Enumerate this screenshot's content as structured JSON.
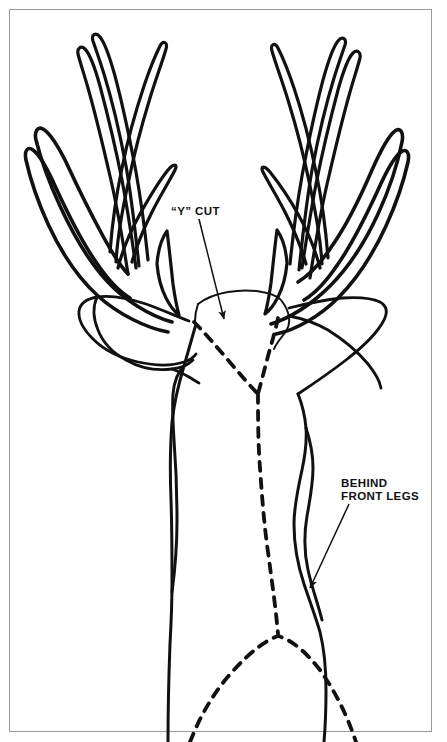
{
  "document": {
    "kind": "line-art-diagram",
    "subject": "deer head and cape with taxidermy cut lines",
    "background_color": "#ffffff",
    "ink_color": "#111111",
    "frame_color": "#9a9a9a"
  },
  "annotations": {
    "y_cut": {
      "label": "“Y” CUT",
      "leader": {
        "from_x": 199,
        "from_y": 219,
        "to_x": 224,
        "to_y": 319
      }
    },
    "behind_front_legs": {
      "label": "BEHIND\nFRONT LEGS",
      "leader": {
        "from_x": 349,
        "from_y": 504,
        "to_x": 310,
        "to_y": 588
      }
    }
  },
  "chart_data": {
    "type": "line",
    "title": "",
    "xlabel": "",
    "ylabel": "",
    "grid": false,
    "legend": "none",
    "xlim": [
      0,
      447
    ],
    "ylim": [
      0,
      742
    ],
    "series": [
      {
        "name": "left-antler-outer-beam",
        "style": "solid",
        "path": "M 172 322 C 150 316 124 300 106 280 C 86 258 72 232 60 206 C 48 180 40 156 36 140 C 34 131 38 126 43 129 C 50 133 58 146 66 162 C 78 188 92 216 104 238 C 114 256 122 268 128 274"
      },
      {
        "name": "left-antler-inner-beam",
        "style": "solid",
        "path": "M 168 332 C 146 328 118 314 98 296 C 76 276 60 250 48 224 C 38 202 30 178 26 160 C 24 150 28 146 33 150 C 40 155 48 170 56 188 C 68 214 82 242 96 262 C 108 280 120 292 130 298"
      },
      {
        "name": "left-antler-tine-1",
        "style": "solid",
        "path": "M 128 274 C 124 248 118 210 110 176 C 104 150 96 116 88 88 C 84 74 80 62 78 54 C 77 48 81 45 85 49 C 90 54 95 68 100 86 C 108 116 116 150 122 180 C 128 212 133 246 136 268"
      },
      {
        "name": "left-antler-tine-2",
        "style": "solid",
        "path": "M 139 266 C 136 238 132 200 126 166 C 120 134 112 100 104 74 C 99 58 95 47 93 41 C 91 34 96 32 100 37 C 105 43 110 58 115 76 C 123 106 130 140 136 172 C 142 206 146 240 148 260"
      },
      {
        "name": "left-antler-tine-3-upper",
        "style": "solid",
        "path": "M 110 252 C 112 226 116 196 122 168 C 128 138 136 110 144 86 C 150 68 156 54 160 46 C 163 40 168 42 166 49 C 163 60 156 78 150 98 C 142 124 134 154 128 184 C 121 216 117 244 116 262"
      },
      {
        "name": "left-antler-mid-fork",
        "style": "solid",
        "path": "M 118 268 C 122 252 130 232 140 214 C 150 196 160 180 168 170 C 174 163 178 164 175 170 C 170 180 160 196 152 212 C 143 230 136 248 132 262"
      },
      {
        "name": "left-brow-tine",
        "style": "solid",
        "path": "M 167 231 C 169 246 171 266 173 284 C 175 298 177 308 179 315 C 175 312 170 306 166 298 C 161 288 158 276 157 264 C 158 250 162 238 167 231"
      },
      {
        "name": "left-ear",
        "style": "solid",
        "path": "M 189 321 C 176 316 160 309 146 304 C 128 298 110 295 97 297 C 86 299 80 304 79 311 C 78 320 84 330 93 339 C 104 350 120 358 138 362 C 156 366 172 366 184 362 C 190 360 194 357 196 354"
      },
      {
        "name": "left-ear-lower-edge",
        "style": "solid",
        "path": "M 97 297 C 93 306 93 318 98 330 C 103 343 113 353 126 360 C 140 368 157 371 172 369 C 182 368 189 364 193 360"
      },
      {
        "name": "left-ear-tip-to-neck",
        "style": "solid",
        "path": "M 172 369 C 178 371 184 374 189 377 C 194 380 197 382 199 383"
      },
      {
        "name": "right-antler-outer-beam",
        "style": "solid",
        "path": "M 271 324 C 290 318 312 304 330 286 C 350 266 366 240 378 214 C 390 188 398 162 402 142 C 404 132 400 127 395 131 C 388 136 380 152 372 170 C 360 198 346 226 332 246 C 320 264 308 276 298 282"
      },
      {
        "name": "right-antler-inner-beam",
        "style": "solid",
        "path": "M 276 334 C 296 330 320 316 338 298 C 358 278 374 252 386 226 C 396 204 404 180 408 162 C 410 152 406 148 401 152 C 394 157 386 172 378 190 C 366 216 352 244 338 264 C 326 282 314 294 304 300"
      },
      {
        "name": "right-antler-tine-1",
        "style": "solid",
        "path": "M 310 278 C 314 252 320 214 328 180 C 334 154 342 120 350 92 C 354 78 358 66 360 58 C 361 52 357 49 353 53 C 348 58 343 72 338 90 C 330 120 322 154 316 184 C 310 216 305 248 302 268"
      },
      {
        "name": "right-antler-tine-2",
        "style": "solid",
        "path": "M 299 270 C 302 242 306 204 312 170 C 318 138 326 104 334 78 C 339 62 343 51 345 45 C 347 38 342 36 338 41 C 333 47 328 62 323 80 C 315 110 308 144 302 176 C 296 210 292 244 290 264"
      },
      {
        "name": "right-antler-tine-3-upper",
        "style": "solid",
        "path": "M 328 258 C 326 232 322 200 316 172 C 310 142 302 112 294 88 C 288 70 282 56 278 48 C 275 42 270 44 272 51 C 275 62 282 80 288 100 C 296 126 304 156 310 186 C 317 218 321 246 322 264"
      },
      {
        "name": "right-antler-mid-fork",
        "style": "solid",
        "path": "M 320 268 C 316 252 308 232 298 214 C 288 196 278 182 270 172 C 264 165 260 166 263 172 C 268 182 278 198 286 214 C 295 232 302 250 306 264"
      },
      {
        "name": "right-brow-tine",
        "style": "solid",
        "path": "M 277 230 C 275 245 273 265 271 283 C 269 297 267 307 265 314 C 269 311 274 305 278 297 C 283 287 286 275 287 263 C 286 249 282 237 277 230"
      },
      {
        "name": "right-ear",
        "style": "solid",
        "path": "M 289 308 C 305 304 324 300 342 298 C 358 297 372 298 380 302 C 387 306 388 312 384 320 C 378 332 364 346 346 360 C 328 374 310 386 298 394"
      },
      {
        "name": "right-ear-lower-edge",
        "style": "solid",
        "path": "M 289 316 C 300 318 314 322 328 330 C 344 340 358 352 368 364 C 376 374 380 382 381 388"
      },
      {
        "name": "skull-plate-top",
        "style": "solid",
        "path": "M 198 304 C 206 298 216 294 228 292 C 240 290 252 290 262 292 C 270 293 276 296 280 299"
      },
      {
        "name": "skull-plate-left-edge",
        "style": "solid",
        "path": "M 198 304 C 196 310 195 316 195 321"
      },
      {
        "name": "skull-right-notch",
        "style": "solid",
        "path": "M 281 300 C 285 305 288 311 289 317 C 290 323 288 329 284 334 C 280 339 276 344 274 349"
      },
      {
        "name": "neck-left-outline",
        "style": "solid",
        "path": "M 196 324 C 192 338 188 352 184 366 C 178 386 174 404 172 422 C 170 448 170 474 171 500 C 172 528 172 556 172 582 C 172 606 171 626 170 644 C 169 670 168 700 168 742"
      },
      {
        "name": "neck-left-outline-waver",
        "style": "solid",
        "path": "M 184 366 C 178 372 174 382 173 394 C 172 408 173 424 174 440 C 176 466 177 494 177 520 C 177 546 175 570 172 592"
      },
      {
        "name": "neck-right-outline",
        "style": "solid",
        "path": "M 298 394 C 302 404 305 416 306 428 C 307 442 305 456 302 470 C 298 488 294 506 294 524 C 294 546 298 566 304 584 C 310 602 316 618 320 632 C 324 648 326 668 326 690 C 326 712 325 730 324 742"
      },
      {
        "name": "neck-right-outline-inner",
        "style": "solid",
        "path": "M 306 428 C 310 440 313 454 313 468 C 313 484 310 500 307 516 C 304 534 304 552 308 570 C 312 588 318 604 322 620"
      },
      {
        "name": "y-cut-left-branch",
        "style": "dashed",
        "path": "M 194 322 C 204 332 216 346 228 360 C 240 374 250 386 258 394"
      },
      {
        "name": "y-cut-right-branch",
        "style": "dashed",
        "path": "M 278 318 C 276 328 272 342 268 356 C 264 372 260 386 258 394"
      },
      {
        "name": "y-cut-center-descender",
        "style": "dashed",
        "path": "M 258 394 C 258 416 258 442 260 468 C 262 496 264 524 268 552 C 272 582 276 610 278 634"
      },
      {
        "name": "brisket-arc-dashed",
        "style": "dashed",
        "path": "M 190 742 C 200 716 214 692 232 672 C 250 652 266 640 278 636 C 292 640 306 652 320 670 C 334 690 346 712 356 742"
      }
    ]
  }
}
